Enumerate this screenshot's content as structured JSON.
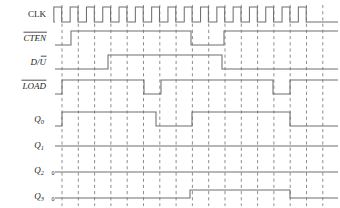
{
  "diagram": {
    "kind": "digital-timing-diagram",
    "title": "",
    "width": 340,
    "height": 208,
    "background": "#ffffff",
    "wave_color": "#6f6f70",
    "grid_color": "#7a7a7c",
    "text_color": "#231f20",
    "clock_pulses": 16,
    "grid_count": 17,
    "grid_start_x": 62,
    "grid_spacing": 16.3,
    "wave_start_x": 55,
    "wave_end_x": 338
  },
  "signals": [
    {
      "name": "CLK",
      "label": "CLK",
      "overbar": false,
      "italic": false,
      "subscript": "",
      "zero_marker": "",
      "row_y": 16,
      "high_y": 7,
      "low_y": 22,
      "label_x": 46,
      "label_y": 17,
      "type": "clock",
      "description": "16 periodic clock pulses across the full trace"
    },
    {
      "name": "CTEN",
      "label": "CTEN",
      "overbar": true,
      "italic": true,
      "subscript": "",
      "zero_marker": "",
      "row_y": 39,
      "high_y": 31,
      "low_y": 45,
      "label_x": 46,
      "label_y": 41,
      "type": "data",
      "levels": [
        0,
        1,
        0,
        1
      ],
      "edges_x": [
        55,
        71,
        191,
        224,
        338
      ],
      "description": "Low at start, rises at 1st grid, dips low between grid 8 and 10, high to end"
    },
    {
      "name": "D/U",
      "label": "D/U",
      "overbar": false,
      "italic": true,
      "subscript": "",
      "zero_marker": "",
      "label_parts": [
        {
          "text": "D/",
          "overbar": false
        },
        {
          "text": "U",
          "overbar": true
        }
      ],
      "row_y": 63,
      "high_y": 55,
      "low_y": 69,
      "label_x": 46,
      "label_y": 65,
      "type": "data",
      "levels": [
        0,
        1,
        0
      ],
      "edges_x": [
        55,
        108,
        222,
        338
      ],
      "description": "Low until grid 3, high through mid-trace, low after grid 10"
    },
    {
      "name": "LOAD",
      "label": "LOAD",
      "overbar": true,
      "italic": true,
      "subscript": "",
      "zero_marker": "",
      "row_y": 87,
      "high_y": 80,
      "low_y": 94,
      "label_x": 46,
      "label_y": 89,
      "type": "data",
      "levels": [
        0,
        1,
        0,
        1,
        0,
        1
      ],
      "edges_x": [
        55,
        62,
        144,
        161,
        273,
        290,
        338
      ],
      "description": "Brief low at start, high, low pulse near grid 5-6, high, low pulse near grid 13-14, high to end"
    },
    {
      "name": "Q0",
      "label": "Q",
      "overbar": false,
      "italic": true,
      "subscript": "0",
      "zero_marker": "",
      "row_y": 119,
      "high_y": 112,
      "low_y": 126,
      "label_x": 44,
      "label_y": 122,
      "type": "output",
      "levels": [
        0,
        1,
        0,
        1,
        0
      ],
      "edges_x": [
        55,
        62,
        156,
        192,
        290,
        338
      ],
      "description": "Low, rises at grid 1, high to grid 6, low to grid 8, high to grid 14, then low"
    },
    {
      "name": "Q1",
      "label": "Q",
      "overbar": false,
      "italic": true,
      "subscript": "1",
      "zero_marker": "",
      "row_y": 146,
      "high_y": 139,
      "low_y": 146,
      "label_x": 44,
      "label_y": 148,
      "type": "output",
      "levels": [
        0
      ],
      "edges_x": [
        55,
        338
      ],
      "description": "Constant low across the entire trace"
    },
    {
      "name": "Q2",
      "label": "Q",
      "overbar": false,
      "italic": true,
      "subscript": "2",
      "zero_marker": "0",
      "row_y": 172,
      "high_y": 165,
      "low_y": 172,
      "label_x": 44,
      "label_y": 173,
      "zero_x": 53,
      "zero_y": 175,
      "type": "output",
      "levels": [
        0
      ],
      "edges_x": [
        55,
        338
      ],
      "description": "Constant low across the entire trace, marked 0"
    },
    {
      "name": "Q3",
      "label": "Q",
      "overbar": false,
      "italic": true,
      "subscript": "3",
      "zero_marker": "0",
      "row_y": 198,
      "high_y": 190,
      "low_y": 198,
      "label_x": 44,
      "label_y": 199,
      "zero_x": 53,
      "zero_y": 201,
      "type": "output",
      "levels": [
        0,
        1,
        0
      ],
      "edges_x": [
        55,
        190,
        290,
        338
      ],
      "description": "Low, rises near grid 8, high to grid 14, then low"
    }
  ]
}
